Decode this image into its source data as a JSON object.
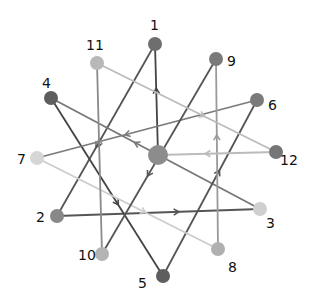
{
  "diagram": {
    "type": "directed-graph",
    "nodes": [
      {
        "id": "c",
        "label": "",
        "x": 158,
        "y": 155,
        "r": 10,
        "color": "#8c8c8c",
        "lx": 0,
        "ly": 0
      },
      {
        "id": "1",
        "label": "1",
        "x": 155,
        "y": 44,
        "r": 7,
        "color": "#6e6e6e",
        "lx": 150,
        "ly": 30
      },
      {
        "id": "2",
        "label": "2",
        "x": 57,
        "y": 216,
        "r": 7,
        "color": "#888888",
        "lx": 36,
        "ly": 222
      },
      {
        "id": "3",
        "label": "3",
        "x": 260,
        "y": 209,
        "r": 7,
        "color": "#cfcfcf",
        "lx": 266,
        "ly": 228
      },
      {
        "id": "4",
        "label": "4",
        "x": 51,
        "y": 98,
        "r": 7,
        "color": "#5e5e5e",
        "lx": 42,
        "ly": 88
      },
      {
        "id": "5",
        "label": "5",
        "x": 163,
        "y": 276,
        "r": 7,
        "color": "#5e5e5e",
        "lx": 138,
        "ly": 288
      },
      {
        "id": "6",
        "label": "6",
        "x": 257,
        "y": 100,
        "r": 7,
        "color": "#7a7a7a",
        "lx": 268,
        "ly": 110
      },
      {
        "id": "7",
        "label": "7",
        "x": 37,
        "y": 158,
        "r": 7,
        "color": "#d6d6d6",
        "lx": 17,
        "ly": 164
      },
      {
        "id": "8",
        "label": "8",
        "x": 218,
        "y": 249,
        "r": 7,
        "color": "#b0b0b0",
        "lx": 228,
        "ly": 272
      },
      {
        "id": "9",
        "label": "9",
        "x": 216,
        "y": 59,
        "r": 7,
        "color": "#7a7a7a",
        "lx": 227,
        "ly": 66
      },
      {
        "id": "10",
        "label": "10",
        "x": 102,
        "y": 254,
        "r": 7,
        "color": "#b4b4b4",
        "lx": 78,
        "ly": 260
      },
      {
        "id": "11",
        "label": "11",
        "x": 97,
        "y": 63,
        "r": 7,
        "color": "#b8b8b8",
        "lx": 86,
        "ly": 50
      },
      {
        "id": "12",
        "label": "12",
        "x": 276,
        "y": 152,
        "r": 7,
        "color": "#767676",
        "lx": 280,
        "ly": 165
      }
    ],
    "edges": [
      {
        "from": "c",
        "to": "1",
        "color": "#444444"
      },
      {
        "from": "1",
        "to": "2",
        "color": "#555555"
      },
      {
        "from": "2",
        "to": "3",
        "color": "#555555"
      },
      {
        "from": "3",
        "to": "4",
        "color": "#777777"
      },
      {
        "from": "4",
        "to": "5",
        "color": "#444444"
      },
      {
        "from": "5",
        "to": "6",
        "color": "#555555"
      },
      {
        "from": "6",
        "to": "7",
        "color": "#7a7a7a"
      },
      {
        "from": "7",
        "to": "8",
        "color": "#cccccc"
      },
      {
        "from": "8",
        "to": "9",
        "color": "#9a9a9a"
      },
      {
        "from": "9",
        "to": "10",
        "color": "#555555"
      },
      {
        "from": "10",
        "to": "11",
        "color": "#8a8a8a"
      },
      {
        "from": "11",
        "to": "12",
        "color": "#bbbbbb"
      },
      {
        "from": "12",
        "to": "c",
        "color": "#bbbbbb"
      }
    ]
  }
}
